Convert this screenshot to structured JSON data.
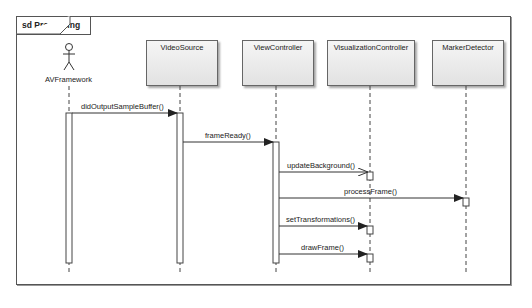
{
  "frame": {
    "label": "sd Processing"
  },
  "lifelines": [
    {
      "name": "AVFramework",
      "kind": "actor",
      "x": 69
    },
    {
      "name": "VideoSource",
      "kind": "object",
      "x": 180
    },
    {
      "name": "ViewController",
      "kind": "object",
      "x": 276
    },
    {
      "name": "VisualizationController",
      "kind": "object",
      "x": 370
    },
    {
      "name": "MarkerDetector",
      "kind": "object",
      "x": 466
    }
  ],
  "messages": [
    {
      "label": "didOutputSampleBuffer()",
      "from": "AVFramework",
      "to": "VideoSource"
    },
    {
      "label": "frameReady()",
      "from": "VideoSource",
      "to": "ViewController"
    },
    {
      "label": "updateBackground()",
      "from": "ViewController",
      "to": "VisualizationController",
      "style": "open-arrow"
    },
    {
      "label": "processFrame()",
      "from": "ViewController",
      "to": "MarkerDetector"
    },
    {
      "label": "setTransformations()",
      "from": "ViewController",
      "to": "VisualizationController"
    },
    {
      "label": "drawFrame()",
      "from": "ViewController",
      "to": "VisualizationController"
    }
  ],
  "colors": {
    "line": "#444444",
    "box_top": "#f5f5f5",
    "box_bottom": "#e2e2e2"
  }
}
